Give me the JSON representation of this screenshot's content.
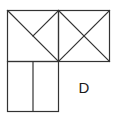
{
  "diagram": {
    "label": "D",
    "stroke_color": "#333333",
    "background": "#ffffff",
    "shapes": {
      "top_left_square": {
        "x1": 7,
        "y1": 10,
        "x2": 58,
        "y2": 61,
        "lines": [
          "diagonal top-left to bottom-right",
          "half-diagonal top-right to center"
        ]
      },
      "top_right_square": {
        "x1": 58,
        "y1": 10,
        "x2": 109,
        "y2": 61,
        "lines": [
          "diagonal top-left to bottom-right",
          "diagonal top-right to bottom-left"
        ]
      },
      "bottom_left_square": {
        "x1": 7,
        "y1": 61,
        "x2": 58,
        "y2": 111,
        "lines": [
          "vertical divider at x=33"
        ]
      }
    }
  }
}
